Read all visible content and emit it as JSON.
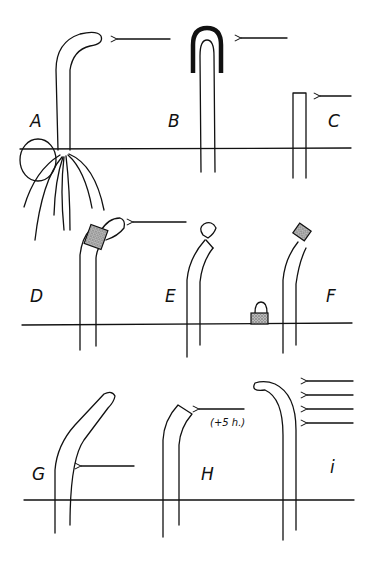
{
  "figure": {
    "panels": [
      {
        "id": "A",
        "label": "A"
      },
      {
        "id": "B",
        "label": "B"
      },
      {
        "id": "C",
        "label": "C"
      },
      {
        "id": "D",
        "label": "D"
      },
      {
        "id": "E",
        "label": "E"
      },
      {
        "id": "F",
        "label": "F"
      },
      {
        "id": "G",
        "label": "G"
      },
      {
        "id": "H",
        "label": "H",
        "note": "(+5 h.)"
      },
      {
        "id": "I",
        "label": "i"
      }
    ],
    "colors": {
      "ink": "#111111",
      "stipple": "#9a9a9a",
      "background": "#ffffff"
    }
  }
}
